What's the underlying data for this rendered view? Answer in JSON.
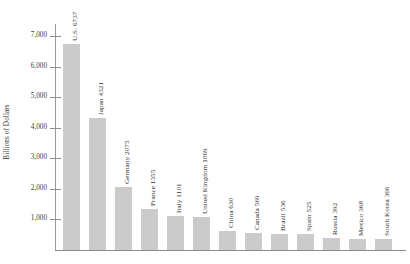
{
  "chart_data": {
    "type": "bar",
    "title": "",
    "subtitle": "",
    "xlabel": "",
    "ylabel": "Billions of Dollars",
    "ylim": [
      0,
      7400
    ],
    "ytick_labels": [
      "7,000",
      "6,000",
      "5,000",
      "4,000",
      "3,000",
      "2,000",
      "1,000"
    ],
    "ytick_values": [
      7000,
      6000,
      5000,
      4000,
      3000,
      2000,
      1000
    ],
    "grid": false,
    "legend": null,
    "orientation": "vertical",
    "bar_color": "#cbcbcb",
    "axis_color": "#8d8d8d",
    "categories": [
      "U.S.",
      "Japan",
      "Germany",
      "France",
      "Italy",
      "United Kingdom",
      "China",
      "Canada",
      "Brazil",
      "Spain",
      "Russia",
      "Mexico",
      "South Korea"
    ],
    "values": [
      6737,
      4321,
      2075,
      1355,
      1101,
      1069,
      630,
      569,
      536,
      525,
      392,
      368,
      366
    ],
    "bar_labels": [
      "U.S. 6737",
      "Japan 4321",
      "Germany 2075",
      "France 1355",
      "Italy 1101",
      "United Kingdom 1069",
      "China 630",
      "Canada 569",
      "Brazil 536",
      "Spain 525",
      "Russia 392",
      "Mexico 368",
      "South Korea 366"
    ]
  }
}
